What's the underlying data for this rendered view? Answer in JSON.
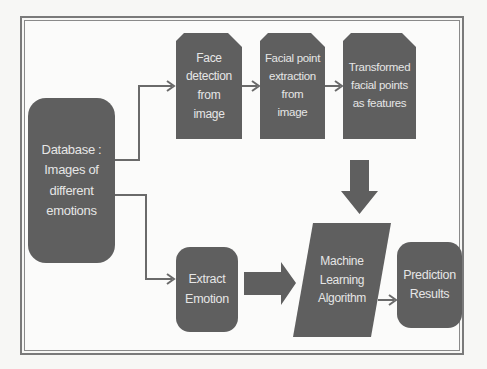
{
  "diagram": {
    "type": "flowchart",
    "colors": {
      "box_fill": "#5f5f5f",
      "box_text": "#e6e6e6",
      "connector": "#6a6a6a",
      "frame": "#7a7a7a",
      "background": "#f7f7f5"
    },
    "nodes": {
      "database": {
        "label": "Database :\nImages of\ndifferent\nemotions",
        "shape": "rounded-rectangle"
      },
      "face_detection": {
        "label": "Face\ndetection\nfrom\nimage",
        "shape": "snipped-rectangle"
      },
      "facial_point_extraction": {
        "label": "Facial point\nextraction\nfrom\nimage",
        "shape": "snipped-rectangle"
      },
      "transformed_points": {
        "label": "Transformed\nfacial points\nas features",
        "shape": "snipped-rectangle"
      },
      "extract_emotion": {
        "label": "Extract\nEmotion",
        "shape": "rounded-rectangle"
      },
      "ml_algorithm": {
        "label": "Machine\nLearning\nAlgorithm",
        "shape": "parallelogram"
      },
      "prediction_results": {
        "label": "Prediction\nResults",
        "shape": "rounded-rectangle"
      }
    },
    "edges": [
      {
        "from": "database",
        "to": "face_detection",
        "style": "line-arrow"
      },
      {
        "from": "face_detection",
        "to": "facial_point_extraction",
        "style": "line-arrow"
      },
      {
        "from": "facial_point_extraction",
        "to": "transformed_points",
        "style": "line-arrow"
      },
      {
        "from": "transformed_points",
        "to": "ml_algorithm",
        "style": "block-arrow-down"
      },
      {
        "from": "database",
        "to": "extract_emotion",
        "style": "line-arrow"
      },
      {
        "from": "extract_emotion",
        "to": "ml_algorithm",
        "style": "block-arrow-right"
      },
      {
        "from": "ml_algorithm",
        "to": "prediction_results",
        "style": "line-arrow"
      }
    ]
  }
}
